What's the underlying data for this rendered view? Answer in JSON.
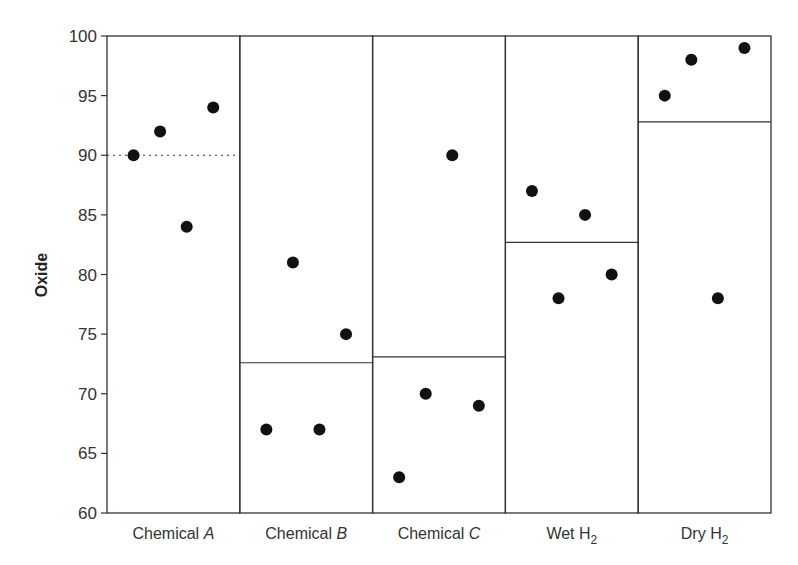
{
  "chart_data": {
    "type": "scatter",
    "title": "",
    "xlabel": "",
    "ylabel": "Oxide",
    "ylim": [
      60,
      100
    ],
    "yticks": [
      60,
      65,
      70,
      75,
      80,
      85,
      90,
      95,
      100
    ],
    "grid": false,
    "legend": null,
    "categories": [
      {
        "name": "Chemical ",
        "italic": "A",
        "sub": ""
      },
      {
        "name": "Chemical ",
        "italic": "B",
        "sub": ""
      },
      {
        "name": "Chemical ",
        "italic": "C",
        "sub": ""
      },
      {
        "name": "Wet H",
        "italic": "",
        "sub": "2"
      },
      {
        "name": "Dry H",
        "italic": "",
        "sub": "2"
      }
    ],
    "panels": [
      {
        "category": "Chemical A",
        "values": [
          90,
          92,
          84,
          94
        ],
        "reference_line": {
          "value": 90,
          "style": "dotted"
        }
      },
      {
        "category": "Chemical B",
        "values": [
          67,
          81,
          67,
          75
        ],
        "reference_line": {
          "value": 72.6,
          "style": "solid"
        }
      },
      {
        "category": "Chemical C",
        "values": [
          63,
          70,
          90,
          69
        ],
        "reference_line": {
          "value": 73.1,
          "style": "solid"
        }
      },
      {
        "category": "Wet H2",
        "values": [
          87,
          78,
          85,
          80
        ],
        "reference_line": {
          "value": 82.7,
          "style": "solid"
        }
      },
      {
        "category": "Dry H2",
        "values": [
          95,
          98,
          78,
          99
        ],
        "reference_line": {
          "value": 92.8,
          "style": "solid"
        }
      }
    ]
  },
  "style": {
    "point_color": "#111111",
    "line_color": "#333333",
    "text_color": "#333333"
  }
}
